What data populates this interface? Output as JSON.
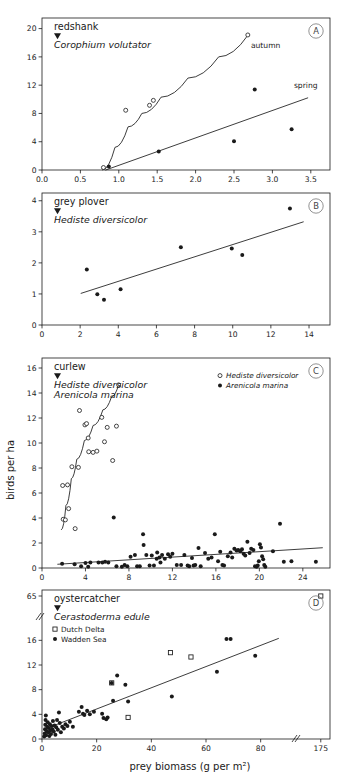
{
  "figure": {
    "y_axis_label": "birds per ha",
    "x_axis_label": "prey biomass (g per m²)",
    "background": "#ffffff",
    "line_color": "#1a1a1a"
  },
  "panels": [
    {
      "id": "A",
      "tag": "A",
      "bird": "redshank",
      "prey": "Corophium volutator",
      "marker_triangle": true,
      "annotations": [
        {
          "name": "autumn-curve-label",
          "text": "autumn",
          "x": 2.72,
          "y": 17.3
        },
        {
          "name": "spring-curve-label",
          "text": "spring",
          "x": 3.28,
          "y": 11.6
        }
      ],
      "xaxis": {
        "min": 0.0,
        "max": 3.75,
        "ticks": [
          0.0,
          0.5,
          1.0,
          1.5,
          2.0,
          2.5,
          3.0,
          3.5
        ],
        "tick_labels": [
          "0.0",
          "0.5",
          "1.0",
          "1.5",
          "2.0",
          "2.5",
          "3.0",
          "3.5"
        ]
      },
      "yaxis": {
        "min": 0,
        "max": 21.5,
        "ticks": [
          0,
          4,
          8,
          12,
          16,
          20
        ],
        "tick_labels": [
          "0",
          "4",
          "8",
          "12",
          "16",
          "20"
        ]
      },
      "series": [
        {
          "name": "autumn",
          "marker": "open-circle",
          "points": [
            [
              0.8,
              0.35
            ],
            [
              1.09,
              8.45
            ],
            [
              1.4,
              9.15
            ],
            [
              1.45,
              9.85
            ],
            [
              2.68,
              19.1
            ]
          ]
        },
        {
          "name": "spring",
          "marker": "filled-circle",
          "points": [
            [
              0.87,
              0.5
            ],
            [
              1.52,
              2.6
            ],
            [
              2.5,
              4.05
            ],
            [
              2.77,
              11.4
            ],
            [
              3.25,
              5.75
            ]
          ]
        }
      ],
      "fitlines": [
        {
          "name": "autumn-fit",
          "type": "curve",
          "path": [
            [
              0.79,
              0.0
            ],
            [
              0.95,
              3.2
            ],
            [
              1.12,
              6.1
            ],
            [
              1.3,
              8.0
            ],
            [
              1.55,
              10.3
            ],
            [
              1.9,
              13.0
            ],
            [
              2.3,
              16.0
            ],
            [
              2.68,
              19.05
            ]
          ]
        },
        {
          "name": "spring-fit",
          "type": "straight",
          "path": [
            [
              0.83,
              0.0
            ],
            [
              3.46,
              10.2
            ]
          ]
        }
      ]
    },
    {
      "id": "B",
      "tag": "B",
      "bird": "grey plover",
      "prey": "Hediste diversicolor",
      "marker_triangle": true,
      "annotations": [],
      "xaxis": {
        "min": 0,
        "max": 15.1,
        "ticks": [
          0,
          2,
          4,
          6,
          8,
          10,
          12,
          14
        ],
        "tick_labels": [
          "0",
          "2",
          "4",
          "6",
          "8",
          "10",
          "12",
          "14"
        ]
      },
      "yaxis": {
        "min": 0,
        "max": 4.25,
        "ticks": [
          0,
          1,
          2,
          3,
          4
        ],
        "tick_labels": [
          "0",
          "1",
          "2",
          "3",
          "4"
        ]
      },
      "series": [
        {
          "name": "grey plover",
          "marker": "filled-circle",
          "points": [
            [
              2.35,
              1.79
            ],
            [
              2.9,
              0.99
            ],
            [
              3.25,
              0.81
            ],
            [
              4.12,
              1.15
            ],
            [
              7.28,
              2.5
            ],
            [
              9.95,
              2.46
            ],
            [
              10.5,
              2.25
            ],
            [
              13.0,
              3.75
            ]
          ]
        }
      ],
      "fitlines": [
        {
          "name": "grey-plover-fit",
          "type": "straight",
          "path": [
            [
              2.05,
              1.02
            ],
            [
              13.7,
              3.32
            ]
          ]
        }
      ]
    },
    {
      "id": "C",
      "tag": "C",
      "bird": "curlew",
      "prey": "Hediste diversicolor",
      "prey2": "Arenicola marina",
      "marker_triangle": true,
      "legend": [
        {
          "label": "Hediste diversicolor",
          "marker": "open-circle"
        },
        {
          "label": "Arenicola marina",
          "marker": "filled-circle"
        }
      ],
      "annotations": [],
      "xaxis": {
        "min": 0,
        "max": 26.5,
        "ticks": [
          0,
          4,
          8,
          12,
          16,
          20,
          24
        ],
        "tick_labels": [
          "0",
          "4",
          "8",
          "12",
          "16",
          "20",
          "24"
        ]
      },
      "yaxis": {
        "min": 0,
        "max": 16.8,
        "ticks": [
          0,
          2,
          4,
          6,
          8,
          10,
          12,
          14,
          16
        ],
        "tick_labels": [
          "0",
          "2",
          "4",
          "6",
          "8",
          "10",
          "12",
          "14",
          "16"
        ]
      },
      "series": [
        {
          "name": "Hediste diversicolor",
          "marker": "open-circle",
          "points": [
            [
              1.95,
              3.9
            ],
            [
              2.15,
              3.85
            ],
            [
              1.9,
              6.6
            ],
            [
              2.35,
              6.65
            ],
            [
              2.45,
              4.75
            ],
            [
              2.75,
              8.1
            ],
            [
              3.05,
              3.15
            ],
            [
              3.35,
              8.05
            ],
            [
              3.45,
              12.6
            ],
            [
              3.95,
              11.45
            ],
            [
              4.1,
              11.55
            ],
            [
              4.3,
              9.3
            ],
            [
              4.25,
              10.4
            ],
            [
              4.7,
              9.25
            ],
            [
              5.05,
              9.35
            ],
            [
              5.5,
              12.05
            ],
            [
              5.75,
              10.1
            ],
            [
              6.0,
              11.25
            ],
            [
              6.85,
              11.35
            ],
            [
              6.5,
              8.6
            ],
            [
              7.05,
              14.65
            ]
          ]
        },
        {
          "name": "Arenicola marina",
          "marker": "filled-circle",
          "points": [
            [
              1.85,
              0.35
            ],
            [
              3.0,
              0.3
            ],
            [
              3.6,
              0.15
            ],
            [
              4.0,
              0.4
            ],
            [
              4.25,
              0.1
            ],
            [
              4.45,
              0.45
            ],
            [
              5.2,
              0.45
            ],
            [
              5.55,
              0.45
            ],
            [
              5.8,
              0.5
            ],
            [
              6.1,
              0.45
            ],
            [
              6.6,
              4.05
            ],
            [
              6.85,
              0.15
            ],
            [
              7.35,
              0.1
            ],
            [
              7.6,
              0.25
            ],
            [
              7.85,
              0.15
            ],
            [
              8.15,
              0.9
            ],
            [
              8.55,
              1.05
            ],
            [
              8.75,
              0.15
            ],
            [
              9.0,
              0.15
            ],
            [
              9.3,
              2.7
            ],
            [
              9.35,
              1.85
            ],
            [
              9.6,
              1.05
            ],
            [
              9.9,
              0.2
            ],
            [
              10.1,
              1.0
            ],
            [
              10.3,
              0.2
            ],
            [
              10.55,
              0.75
            ],
            [
              10.6,
              1.25
            ],
            [
              10.8,
              0.85
            ],
            [
              10.9,
              0.45
            ],
            [
              11.05,
              1.05
            ],
            [
              11.3,
              0.75
            ],
            [
              11.6,
              1.1
            ],
            [
              11.8,
              0.9
            ],
            [
              12.0,
              1.15
            ],
            [
              12.4,
              0.25
            ],
            [
              12.8,
              0.25
            ],
            [
              13.1,
              1.05
            ],
            [
              13.4,
              0.2
            ],
            [
              13.55,
              0.15
            ],
            [
              13.8,
              0.8
            ],
            [
              13.95,
              0.2
            ],
            [
              14.1,
              0.25
            ],
            [
              14.4,
              1.6
            ],
            [
              14.6,
              0.15
            ],
            [
              15.0,
              1.2
            ],
            [
              15.3,
              0.75
            ],
            [
              15.6,
              0.85
            ],
            [
              15.9,
              2.7
            ],
            [
              16.2,
              0.55
            ],
            [
              16.4,
              1.3
            ],
            [
              16.6,
              0.25
            ],
            [
              16.75,
              0.2
            ],
            [
              17.1,
              0.95
            ],
            [
              17.35,
              1.25
            ],
            [
              17.5,
              0.85
            ],
            [
              17.7,
              1.55
            ],
            [
              17.9,
              1.4
            ],
            [
              18.05,
              1.45
            ],
            [
              18.25,
              1.35
            ],
            [
              18.4,
              1.5
            ],
            [
              18.55,
              1.15
            ],
            [
              18.7,
              1.0
            ],
            [
              18.9,
              2.1
            ],
            [
              19.1,
              1.2
            ],
            [
              19.25,
              1.55
            ],
            [
              19.45,
              1.45
            ],
            [
              19.6,
              0.15
            ],
            [
              19.75,
              0.1
            ],
            [
              19.85,
              0.2
            ],
            [
              19.95,
              0.55
            ],
            [
              20.05,
              1.9
            ],
            [
              20.15,
              1.65
            ],
            [
              20.25,
              0.95
            ],
            [
              20.35,
              0.7
            ],
            [
              20.45,
              0.25
            ],
            [
              20.55,
              0.1
            ],
            [
              21.25,
              1.35
            ],
            [
              21.9,
              3.55
            ],
            [
              22.25,
              0.5
            ],
            [
              22.95,
              0.55
            ],
            [
              25.2,
              0.5
            ]
          ]
        }
      ],
      "fitlines": [
        {
          "name": "hediste-fit",
          "type": "curve",
          "path": [
            [
              1.8,
              3.05
            ],
            [
              2.2,
              5.0
            ],
            [
              2.7,
              7.15
            ],
            [
              3.2,
              8.7
            ],
            [
              3.9,
              10.2
            ],
            [
              4.7,
              11.4
            ],
            [
              5.6,
              12.65
            ],
            [
              6.4,
              13.7
            ],
            [
              7.05,
              14.65
            ]
          ]
        },
        {
          "name": "arenicola-fit",
          "type": "straight",
          "path": [
            [
              1.45,
              0.3
            ],
            [
              25.8,
              1.62
            ]
          ]
        }
      ]
    },
    {
      "id": "D",
      "tag": "D",
      "bird": "oystercatcher",
      "prey": "Cerastoderma edule",
      "marker_triangle": true,
      "legend": [
        {
          "label": "Dutch Delta",
          "marker": "open-square"
        },
        {
          "label": "Wadden Sea",
          "marker": "filled-circle"
        }
      ],
      "annotations": [],
      "axis_breaks": {
        "x": true,
        "y": true
      },
      "xaxis": {
        "min": 0,
        "max": 100,
        "ticks": [
          0,
          20,
          40,
          60,
          80,
          175
        ],
        "tick_labels": [
          "0",
          "20",
          "40",
          "60",
          "80",
          "175"
        ]
      },
      "yaxis": {
        "min": 0,
        "max": 20,
        "ticks": [
          0,
          4,
          8,
          12,
          16,
          65
        ],
        "tick_labels": [
          "0",
          "4",
          "8",
          "12",
          "16",
          "65"
        ]
      },
      "series": [
        {
          "name": "Dutch Delta",
          "marker": "open-square",
          "points": [
            [
              25.5,
              9.1
            ],
            [
              31.5,
              3.5
            ],
            [
              47.0,
              14.0
            ],
            [
              54.5,
              13.3
            ],
            [
              175.0,
              65.0
            ]
          ]
        },
        {
          "name": "Wadden Sea",
          "marker": "filled-circle",
          "points": [
            [
              0.8,
              0.4
            ],
            [
              1.0,
              0.9
            ],
            [
              1.1,
              1.6
            ],
            [
              1.2,
              2.3
            ],
            [
              1.3,
              3.1
            ],
            [
              1.4,
              3.8
            ],
            [
              1.5,
              0.6
            ],
            [
              1.7,
              1.3
            ],
            [
              1.9,
              2.0
            ],
            [
              2.1,
              2.7
            ],
            [
              2.3,
              1.1
            ],
            [
              2.5,
              1.8
            ],
            [
              2.7,
              0.5
            ],
            [
              2.9,
              2.4
            ],
            [
              3.1,
              1.4
            ],
            [
              3.3,
              0.8
            ],
            [
              3.5,
              2.1
            ],
            [
              3.8,
              1.6
            ],
            [
              4.0,
              2.9
            ],
            [
              4.3,
              1.2
            ],
            [
              4.6,
              2.2
            ],
            [
              4.9,
              0.7
            ],
            [
              5.2,
              1.9
            ],
            [
              5.5,
              3.1
            ],
            [
              5.8,
              1.5
            ],
            [
              6.2,
              4.3
            ],
            [
              6.5,
              2.6
            ],
            [
              6.9,
              1.1
            ],
            [
              7.4,
              2.0
            ],
            [
              8.0,
              1.7
            ],
            [
              8.6,
              2.4
            ],
            [
              9.3,
              2.1
            ],
            [
              10.2,
              2.8
            ],
            [
              11.3,
              2.0
            ],
            [
              13.5,
              4.4
            ],
            [
              14.5,
              5.2
            ],
            [
              15.0,
              4.1
            ],
            [
              15.5,
              3.9
            ],
            [
              16.5,
              4.6
            ],
            [
              17.5,
              4.0
            ],
            [
              19.0,
              4.4
            ],
            [
              22.0,
              4.1
            ],
            [
              22.5,
              3.4
            ],
            [
              23.5,
              3.2
            ],
            [
              24.0,
              3.5
            ],
            [
              25.5,
              9.1
            ],
            [
              26.0,
              6.2
            ],
            [
              27.5,
              10.3
            ],
            [
              30.5,
              8.8
            ],
            [
              31.5,
              6.1
            ],
            [
              47.5,
              6.9
            ],
            [
              64.0,
              10.9
            ],
            [
              67.5,
              16.2
            ],
            [
              69.0,
              16.2
            ],
            [
              78.0,
              13.5
            ]
          ]
        }
      ],
      "fitlines": [
        {
          "name": "oystercatcher-fit",
          "type": "straight",
          "path": [
            [
              1.0,
              1.6
            ],
            [
              86.5,
              16.3
            ]
          ]
        }
      ]
    }
  ]
}
